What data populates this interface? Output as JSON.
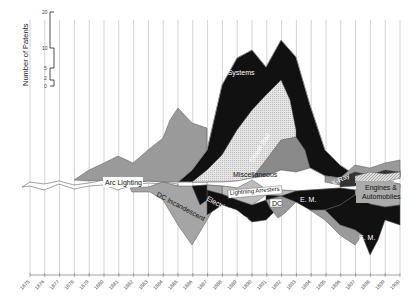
{
  "chart_data": {
    "type": "area",
    "subtype": "streamgraph",
    "title": "",
    "ylabel": "Number of Patents",
    "xlabel": "",
    "scale_ticks": [
      20,
      10,
      5,
      2,
      0
    ],
    "x": [
      1875,
      1876,
      1877,
      1878,
      1879,
      1880,
      1881,
      1882,
      1883,
      1884,
      1885,
      1886,
      1887,
      1888,
      1889,
      1890,
      1891,
      1892,
      1893,
      1894,
      1895,
      1896,
      1897,
      1898,
      1899,
      1900
    ],
    "series": [
      {
        "name": "Arc Lighting",
        "color": "#9a9a9a",
        "label_pos": [
          120,
          184
        ]
      },
      {
        "name": "AC Systems",
        "color": "#111111",
        "label_pos": [
          225,
          74
        ]
      },
      {
        "name": "Electric Welding",
        "color": "#d8d8d8",
        "label_pos": [
          232,
          130
        ]
      },
      {
        "name": "Street Rail",
        "color": "#8a8a8a",
        "label_pos": [
          254,
          152
        ]
      },
      {
        "name": "Miscellaneous",
        "color": "#ffffff",
        "label_pos": [
          248,
          175
        ]
      },
      {
        "name": "X-Ray",
        "color": "#333333",
        "label_pos": [
          338,
          180
        ]
      },
      {
        "name": "Engines & Automobiles",
        "color": "#aaaaaa",
        "label_pos": [
          382,
          192
        ]
      },
      {
        "name": "Lightning Arresters",
        "color": "#bdbdbd",
        "label_pos": [
          265,
          193
        ]
      },
      {
        "name": "DC",
        "color": "#9a9a9a",
        "label_pos": [
          279,
          206
        ]
      },
      {
        "name": "DC Incandescent",
        "color": "#a5a5a5",
        "label_pos": [
          150,
          214
        ]
      },
      {
        "name": "Electric Motors",
        "color": "#111111",
        "label_pos": [
          225,
          210
        ]
      },
      {
        "name": "E. M.",
        "color": "#111111",
        "label_pos": [
          308,
          201
        ]
      },
      {
        "name": "E. M. (2)",
        "color": "#111111",
        "label_pos": [
          368,
          237
        ]
      }
    ],
    "grid": true,
    "legend": "inline labels"
  },
  "labels": {
    "arc_lighting": "Arc Lighting",
    "ac_systems": "AC Systems",
    "electric_welding": "Electric Welding",
    "street_rail": "Street Rail",
    "miscellaneous": "Miscellaneous",
    "xray": "X-Ray",
    "engines": "Engines &",
    "automobiles": "Automobiles",
    "lightning_arresters": "Lightning Arresters",
    "dc": "DC",
    "dc_incandescent": "DC Incandescent",
    "electric_motors": "Electric Motors",
    "em1": "E. M.",
    "em2": "E. M."
  },
  "axis": {
    "ylabel": "Number of Patents",
    "scale": [
      "20",
      "10",
      "5",
      "2",
      "0"
    ],
    "years": [
      "1875",
      "1876",
      "1877",
      "1878",
      "1879",
      "1880",
      "1881",
      "1882",
      "1883",
      "1884",
      "1885",
      "1886",
      "1887",
      "1888",
      "1889",
      "1890",
      "1891",
      "1892",
      "1893",
      "1894",
      "1895",
      "1896",
      "1897",
      "1898",
      "1899",
      "1900"
    ]
  }
}
